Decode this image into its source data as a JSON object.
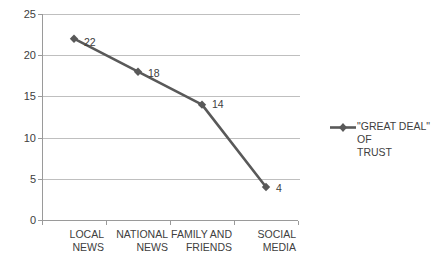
{
  "chart_data": {
    "type": "line",
    "title": "",
    "xlabel": "",
    "ylabel": "",
    "categories": [
      "LOCAL NEWS",
      "NATIONAL NEWS",
      "FAMILY AND FRIENDS",
      "SOCIAL MEDIA"
    ],
    "series": [
      {
        "name": "\"GREAT DEAL\" OF TRUST",
        "values": [
          22,
          18,
          14,
          4
        ],
        "color": "#595959",
        "marker": "diamond"
      }
    ],
    "data_labels": [
      "22",
      "18",
      "14",
      "4"
    ],
    "ylim": [
      0,
      25
    ],
    "yticks": [
      0,
      5,
      10,
      15,
      20,
      25
    ],
    "ytick_labels": [
      "0",
      "5",
      "10",
      "15",
      "20",
      "25"
    ],
    "grid": "horizontal",
    "legend_position": "right",
    "legend_entries": [
      {
        "label_line1": "\"GREAT DEAL\" OF",
        "label_line2": "TRUST",
        "color": "#595959"
      }
    ],
    "colors": {
      "series": "#595959",
      "gridline": "#bfbfbf",
      "axis": "#9a9a9a",
      "text": "#404040",
      "background": "#ffffff"
    }
  }
}
